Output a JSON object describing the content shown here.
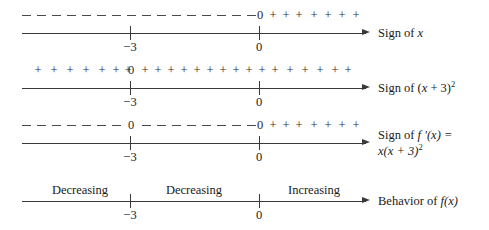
{
  "figure": {
    "axis_points": [
      "-3",
      "0"
    ],
    "rows": [
      {
        "id": "sign-of-x",
        "caption_line1_pre": "Sign of ",
        "caption_line1_italic": "x",
        "caption_line1_post": "",
        "caption_line2": "",
        "tick_labels": [
          "−3",
          "0"
        ],
        "symbols": "dashes from left to 0, then zero, then plus signs",
        "segments": [
          {
            "type": "dash",
            "from": 22,
            "to": 252,
            "count": 17
          },
          {
            "type": "zero",
            "at": 259,
            "text": "0"
          },
          {
            "type": "plus",
            "from": 272,
            "to": 352,
            "count": 7,
            "text": "+"
          }
        ]
      },
      {
        "id": "sign-of-x-plus-3-squared",
        "caption_line1_pre": "Sign of (",
        "caption_line1_italic": "x",
        "caption_line1_post": " + 3)",
        "caption_superscript": "2",
        "caption_line2": "",
        "tick_labels": [
          "−3",
          "0"
        ],
        "symbols": "plus signs, zero at -3, plus signs onward",
        "segments": [
          {
            "type": "plus",
            "from": 34,
            "to": 118,
            "count": 7,
            "text": "+"
          },
          {
            "type": "zero",
            "at": 130,
            "text": "0"
          },
          {
            "type": "plus",
            "from": 143,
            "to": 347,
            "count": 17,
            "text": "+"
          }
        ]
      },
      {
        "id": "sign-of-f-prime",
        "caption_line1_pre": "Sign of ",
        "caption_line1_italic": "f",
        "caption_line1_post": " ′(x) =",
        "caption_line2_italic": "x",
        "caption_line2_post": "(x + 3)",
        "caption_superscript": "2",
        "tick_labels": [
          "−3",
          "0"
        ],
        "symbols": "dashes, zero at -3, dashes, zero at 0, plus signs",
        "segments": [
          {
            "type": "dash",
            "from": 22,
            "to": 120,
            "count": 7
          },
          {
            "type": "zero",
            "at": 130,
            "text": "0"
          },
          {
            "type": "dash",
            "from": 142,
            "to": 250,
            "count": 8
          },
          {
            "type": "zero",
            "at": 259,
            "text": "0"
          },
          {
            "type": "plus",
            "from": 272,
            "to": 352,
            "count": 7,
            "text": "+"
          }
        ]
      },
      {
        "id": "behavior-of-f",
        "caption_line1_pre": "Behavior of ",
        "caption_line1_italic": "f",
        "caption_line1_post": "(x)",
        "caption_line2": "",
        "tick_labels": [
          "−3",
          "0"
        ],
        "regions": [
          {
            "label": "Decreasing",
            "center": 76
          },
          {
            "label": "Decreasing",
            "center": 194
          },
          {
            "label": "Increasing",
            "center": 314
          }
        ]
      }
    ],
    "colors": {
      "ink": "#1a1a1a",
      "line": "#3a3a3a",
      "symbol": "#2b2b2b",
      "background": "#ffffff"
    }
  }
}
